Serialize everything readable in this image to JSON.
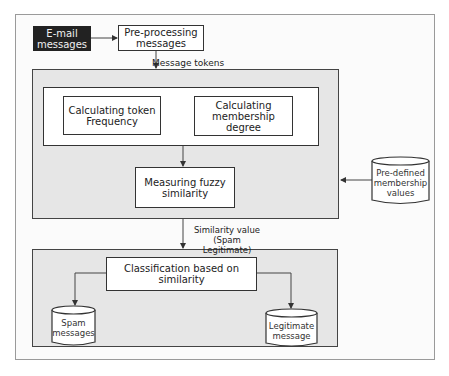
{
  "diagram": {
    "nodes": {
      "email": {
        "label": "E-mail messages",
        "line1": "E-mail",
        "line2": "messages"
      },
      "preprocessing": {
        "label": "Pre-processing messages",
        "line1": "Pre-processing",
        "line2": "messages"
      },
      "token_frequency": {
        "label": "Calculating token Frequency",
        "line1": "Calculating token",
        "line2": "Frequency"
      },
      "membership_degree": {
        "label": "Calculating membership degree",
        "line1": "Calculating",
        "line2": "membership",
        "line3": "degree"
      },
      "fuzzy_similarity": {
        "label": "Measuring fuzzy similarity",
        "line1": "Measuring fuzzy",
        "line2": "similarity"
      },
      "predefined_values": {
        "label": "Pre-defined membership values",
        "line1": "Pre-defined",
        "line2": "membership",
        "line3": "values"
      },
      "classification": {
        "label": "Classification based on similarity",
        "line1": "Classification based on",
        "line2": "similarity"
      },
      "spam": {
        "label": "Spam messages",
        "line1": "Spam",
        "line2": "messages"
      },
      "legitimate": {
        "label": "Legitimate message",
        "line1": "Legitimate",
        "line2": "message"
      }
    },
    "edge_labels": {
      "message_tokens": "Message tokens",
      "similarity_line1": "Similarity value",
      "similarity_line2": "(Spam Legitimate)"
    },
    "edges": [
      {
        "from": "email",
        "to": "preprocessing"
      },
      {
        "from": "preprocessing",
        "to": "processing_group",
        "label": "Message tokens"
      },
      {
        "from": "feature_group",
        "to": "fuzzy_similarity"
      },
      {
        "from": "predefined_values",
        "to": "processing_group"
      },
      {
        "from": "processing_group",
        "to": "classification_group",
        "label": "Similarity value (Spam Legitimate)"
      },
      {
        "from": "classification",
        "to": "spam"
      },
      {
        "from": "classification",
        "to": "legitimate"
      }
    ],
    "colors": {
      "dark_node": "#222222",
      "group_fill": "#e6e6e6",
      "stroke": "#333333"
    }
  }
}
